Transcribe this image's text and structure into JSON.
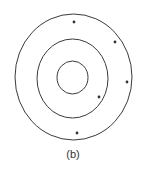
{
  "figure": {
    "caption": "(b)",
    "stroke_color": "#3a3a3a",
    "dot_color": "#333333",
    "rings": [
      {
        "name": "inner",
        "cx": 72.5,
        "cy": 77.5,
        "rx": 15.5,
        "ry": 16.5
      },
      {
        "name": "middle",
        "cx": 72.5,
        "cy": 78.5,
        "rx": 35.5,
        "ry": 39.5
      },
      {
        "name": "outer",
        "cx": 73.5,
        "cy": 77,
        "rx": 58.5,
        "ry": 63
      }
    ],
    "dots": [
      {
        "x": 74,
        "y": 22
      },
      {
        "x": 115,
        "y": 42
      },
      {
        "x": 127,
        "y": 82
      },
      {
        "x": 99,
        "y": 97
      },
      {
        "x": 77,
        "y": 133
      }
    ]
  }
}
